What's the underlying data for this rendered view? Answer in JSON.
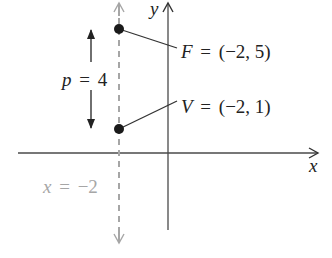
{
  "diagram": {
    "type": "parabola-focus-vertex",
    "axes": {
      "x_label": "x",
      "y_label": "y"
    },
    "directrix_like_line": {
      "label_var": "x",
      "label_eq": "=",
      "label_value": "−2",
      "style": "dashed",
      "color": "#a6a6a6"
    },
    "points": [
      {
        "name": "F",
        "eq": "=",
        "coords": "(−2, 5)"
      },
      {
        "name": "V",
        "eq": "=",
        "coords": "(−2, 1)"
      }
    ],
    "distance": {
      "var": "p",
      "eq": "=",
      "value": "4"
    },
    "colors": {
      "ink": "#1f1f1f",
      "gray": "#a6a6a6",
      "axis": "#4a4a4a"
    }
  }
}
